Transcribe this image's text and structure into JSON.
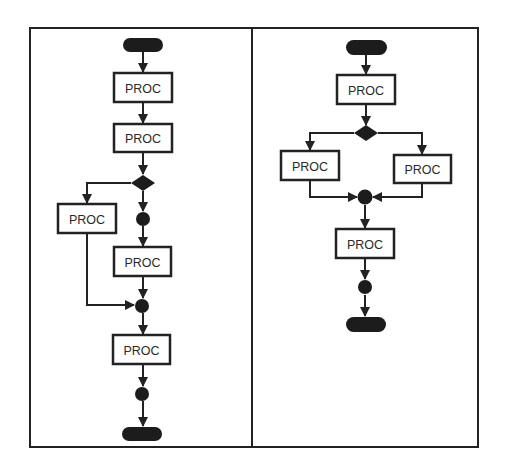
{
  "diagram": {
    "type": "flowchart-comparison",
    "colors": {
      "background": "#ffffff",
      "stroke": "#222222",
      "fill": "#1c1c1c",
      "text": "#2a2a2a"
    },
    "panels": [
      {
        "id": "left",
        "description": "Nested branching flow: one branch with a single PROC, other branch with junction then PROC",
        "nodes": [
          {
            "id": "L-start",
            "type": "terminator",
            "label": ""
          },
          {
            "id": "L-p1",
            "type": "process",
            "label": "PROC"
          },
          {
            "id": "L-p2",
            "type": "process",
            "label": "PROC"
          },
          {
            "id": "L-d1",
            "type": "decision",
            "label": ""
          },
          {
            "id": "L-p3",
            "type": "process",
            "label": "PROC"
          },
          {
            "id": "L-j1",
            "type": "junction",
            "label": ""
          },
          {
            "id": "L-p4",
            "type": "process",
            "label": "PROC"
          },
          {
            "id": "L-j2",
            "type": "junction",
            "label": ""
          },
          {
            "id": "L-p5",
            "type": "process",
            "label": "PROC"
          },
          {
            "id": "L-j3",
            "type": "junction",
            "label": ""
          },
          {
            "id": "L-end",
            "type": "terminator",
            "label": ""
          }
        ],
        "edges": [
          [
            "L-start",
            "L-p1"
          ],
          [
            "L-p1",
            "L-p2"
          ],
          [
            "L-p2",
            "L-d1"
          ],
          [
            "L-d1",
            "L-p3"
          ],
          [
            "L-d1",
            "L-j1"
          ],
          [
            "L-j1",
            "L-p4"
          ],
          [
            "L-p3",
            "L-j2"
          ],
          [
            "L-p4",
            "L-j2"
          ],
          [
            "L-j2",
            "L-p5"
          ],
          [
            "L-p5",
            "L-j3"
          ],
          [
            "L-j3",
            "L-end"
          ]
        ]
      },
      {
        "id": "right",
        "description": "Simple if-else flow: decision splits into two PROC branches that merge",
        "nodes": [
          {
            "id": "R-start",
            "type": "terminator",
            "label": ""
          },
          {
            "id": "R-p1",
            "type": "process",
            "label": "PROC"
          },
          {
            "id": "R-d1",
            "type": "decision",
            "label": ""
          },
          {
            "id": "R-p2",
            "type": "process",
            "label": "PROC"
          },
          {
            "id": "R-p3",
            "type": "process",
            "label": "PROC"
          },
          {
            "id": "R-j1",
            "type": "junction",
            "label": ""
          },
          {
            "id": "R-p4",
            "type": "process",
            "label": "PROC"
          },
          {
            "id": "R-j2",
            "type": "junction",
            "label": ""
          },
          {
            "id": "R-end",
            "type": "terminator",
            "label": ""
          }
        ],
        "edges": [
          [
            "R-start",
            "R-p1"
          ],
          [
            "R-p1",
            "R-d1"
          ],
          [
            "R-d1",
            "R-p2"
          ],
          [
            "R-d1",
            "R-p3"
          ],
          [
            "R-p2",
            "R-j1"
          ],
          [
            "R-p3",
            "R-j1"
          ],
          [
            "R-j1",
            "R-p4"
          ],
          [
            "R-p4",
            "R-j2"
          ],
          [
            "R-j2",
            "R-end"
          ]
        ]
      }
    ]
  }
}
